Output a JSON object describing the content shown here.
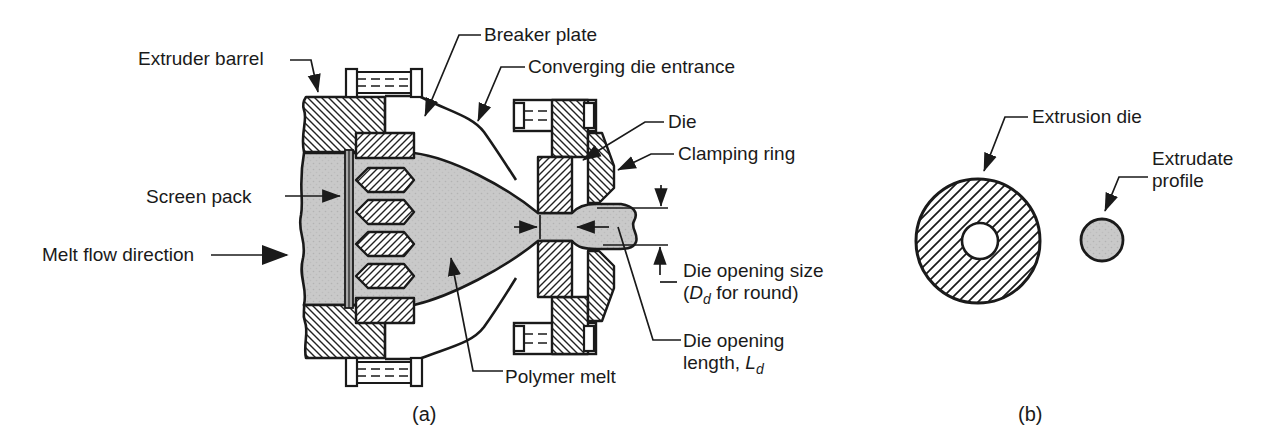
{
  "figure": {
    "panel_a": {
      "caption": "(a)",
      "labels": {
        "extruder_barrel": "Extruder barrel",
        "breaker_plate": "Breaker plate",
        "converging_die_entrance": "Converging die entrance",
        "die": "Die",
        "clamping_ring": "Clamping ring",
        "screen_pack": "Screen pack",
        "melt_flow_direction": "Melt flow direction",
        "die_opening_size_line1": "Die opening size",
        "die_opening_size_pre": "(",
        "die_opening_size_sym": "D",
        "die_opening_size_sub": "d",
        "die_opening_size_post": " for round)",
        "die_opening_length_line1": "Die opening",
        "die_opening_length_pre": "length, ",
        "die_opening_length_sym": "L",
        "die_opening_length_sub": "d",
        "polymer_melt": "Polymer melt"
      }
    },
    "panel_b": {
      "caption": "(b)",
      "labels": {
        "extrusion_die": "Extrusion die",
        "extrudate_profile_line1": "Extrudate",
        "extrudate_profile_line2": "profile"
      }
    },
    "colors": {
      "line": "#1a1a1a",
      "melt_fill": "#c9c9c9",
      "metal_fill": "#ffffff",
      "background": "#ffffff"
    }
  }
}
